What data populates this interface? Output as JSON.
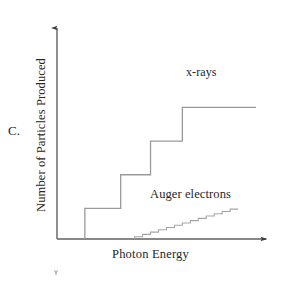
{
  "figure": {
    "panel_label": "C.",
    "x_axis_label": "Photon Energy",
    "y_axis_label": "Number of Particles Produced",
    "series_labels": {
      "xrays": "x-rays",
      "auger": "Auger electrons"
    },
    "colors": {
      "axis": "#4d4d4d",
      "curve": "#808080",
      "text": "#262626",
      "background": "#ffffff"
    }
  },
  "chart_data": {
    "type": "line",
    "title": "",
    "subtitle": "",
    "xlabel": "Photon Energy",
    "ylabel": "Number of Particles Produced",
    "xlim": [
      0,
      100
    ],
    "ylim": [
      0,
      100
    ],
    "grid": false,
    "legend": "inline-annotations",
    "axis_ticks": {
      "x": [],
      "y": []
    },
    "annotations": [
      {
        "text": "x-rays",
        "x": 62,
        "y": 88
      },
      {
        "text": "Auger electrons",
        "x": 46,
        "y": 26
      },
      {
        "text": "C.",
        "x": -22,
        "y": 50
      }
    ],
    "series": [
      {
        "name": "x-rays",
        "style": "step",
        "step_count": 4,
        "x": [
          14,
          14,
          32,
          32,
          47,
          47,
          63,
          63,
          100
        ],
        "values": [
          0,
          20,
          20,
          42,
          42,
          64,
          64,
          86,
          86
        ]
      },
      {
        "name": "Auger electrons",
        "style": "step",
        "step_count": 13,
        "x": [
          39,
          39,
          43,
          43,
          47,
          47,
          51,
          51,
          55,
          55,
          59,
          59,
          63,
          63,
          67,
          67,
          71,
          71,
          75,
          75,
          79,
          79,
          83,
          83,
          87,
          87,
          91
        ],
        "values": [
          0,
          1.5,
          1.5,
          3,
          3,
          4.5,
          4.5,
          6,
          6,
          7.5,
          7.5,
          9,
          9,
          10.5,
          10.5,
          12,
          12,
          13.5,
          13.5,
          15,
          15,
          16.5,
          16.5,
          18,
          18,
          19.5,
          19.5
        ]
      }
    ]
  }
}
